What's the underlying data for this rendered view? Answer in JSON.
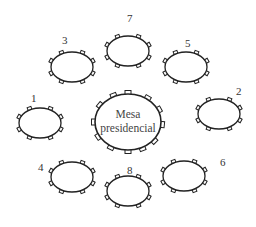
{
  "diagram": {
    "title": "",
    "center_table": {
      "label_line1": "Mesa",
      "label_line2": "presidencial",
      "cx": 128,
      "cy": 122,
      "rx": 33,
      "ry": 28
    },
    "tables": [
      {
        "number": "1",
        "cx": 40,
        "cy": 123,
        "label_x": 31,
        "label_y": 93
      },
      {
        "number": "2",
        "cx": 219,
        "cy": 114,
        "label_x": 236,
        "label_y": 86
      },
      {
        "number": "3",
        "cx": 72,
        "cy": 67,
        "label_x": 62,
        "label_y": 35
      },
      {
        "number": "4",
        "cx": 72,
        "cy": 177,
        "label_x": 38,
        "label_y": 162
      },
      {
        "number": "5",
        "cx": 186,
        "cy": 67,
        "label_x": 185,
        "label_y": 38
      },
      {
        "number": "6",
        "cx": 184,
        "cy": 176,
        "label_x": 220,
        "label_y": 157
      },
      {
        "number": "7",
        "cx": 128,
        "cy": 51,
        "label_x": 127,
        "label_y": 13
      },
      {
        "number": "8",
        "cx": 128,
        "cy": 191,
        "label_x": 127,
        "label_y": 165
      }
    ],
    "colors": {
      "stroke": "#222222",
      "text": "#333333",
      "background": "#ffffff"
    }
  }
}
